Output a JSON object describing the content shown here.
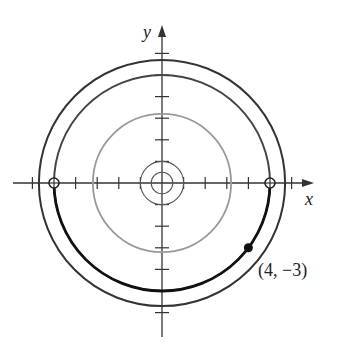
{
  "diagram": {
    "type": "polar-path-circles",
    "axes": {
      "x_label": "x",
      "y_label": "y",
      "tick_spacing_units": 1,
      "x_ticks": [
        -6,
        -5,
        -4,
        -3,
        -2,
        -1,
        1,
        2,
        3,
        4,
        5,
        6
      ],
      "y_ticks": [
        -6,
        -5,
        -4,
        -3,
        -2,
        -1,
        1,
        2,
        3,
        4,
        5,
        6
      ]
    },
    "circles": [
      {
        "name": "outer-circle",
        "radius": 5.7,
        "color": "#333333",
        "stroke": "dark"
      },
      {
        "name": "radius-5-circle",
        "radius": 5,
        "color": "#444444",
        "stroke": "dark"
      },
      {
        "name": "gray-circle",
        "radius": 3.2,
        "color": "#999999",
        "stroke": "light"
      },
      {
        "name": "small-circle-1",
        "radius": 1,
        "color": "#555555",
        "stroke": "thin"
      },
      {
        "name": "small-circle-05",
        "radius": 0.5,
        "color": "#555555",
        "stroke": "thin"
      }
    ],
    "highlighted_path": {
      "description": "lower half of radius-5 circle from (-5,0) to (5,0)",
      "color": "#111111"
    },
    "points": [
      {
        "label": "",
        "x": -5,
        "y": 0,
        "style": "open"
      },
      {
        "label": "",
        "x": 5,
        "y": 0,
        "style": "open"
      },
      {
        "label": "(4, −3)",
        "x": 4,
        "y": -3,
        "style": "filled"
      }
    ],
    "point_label": "(4, −3)"
  }
}
